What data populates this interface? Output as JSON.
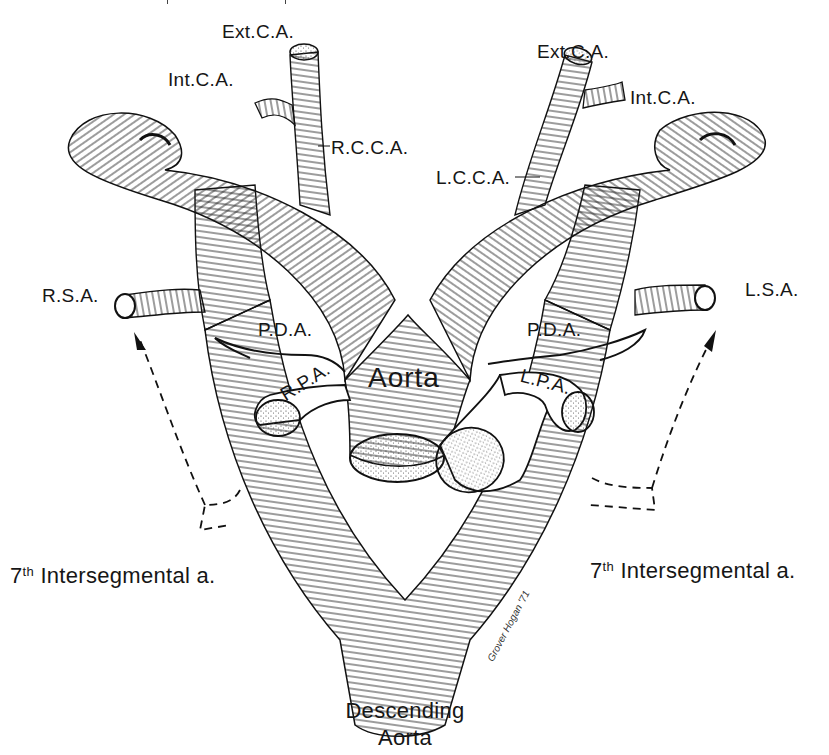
{
  "figure": {
    "type": "anatomical-line-drawing",
    "signature": "Grover Hogan '71"
  },
  "labels": {
    "ext_ca_right": "Ext.C.A.",
    "int_ca_right": "Int.C.A.",
    "rcca": "R.C.C.A.",
    "ext_ca_left": "Ext.C.A.",
    "int_ca_left": "Int.C.A.",
    "lcca": "L.C.C.A.",
    "rsa": "R.S.A.",
    "lsa": "L.S.A.",
    "pda_right": "P.D.A.",
    "pda_left": "P.D.A.",
    "rpa": "R.P.A.",
    "lpa": "L.P.A.",
    "aorta": "Aorta",
    "intersegmental_right_num": "7",
    "intersegmental_right_sup": "th",
    "intersegmental_right_text": "Intersegmental a.",
    "intersegmental_left_num": "7",
    "intersegmental_left_sup": "th",
    "intersegmental_left_text": "Intersegmental a.",
    "descending_line1": "Descending",
    "descending_line2": "Aorta"
  },
  "colors": {
    "ink": "#111111",
    "background": "#ffffff"
  }
}
